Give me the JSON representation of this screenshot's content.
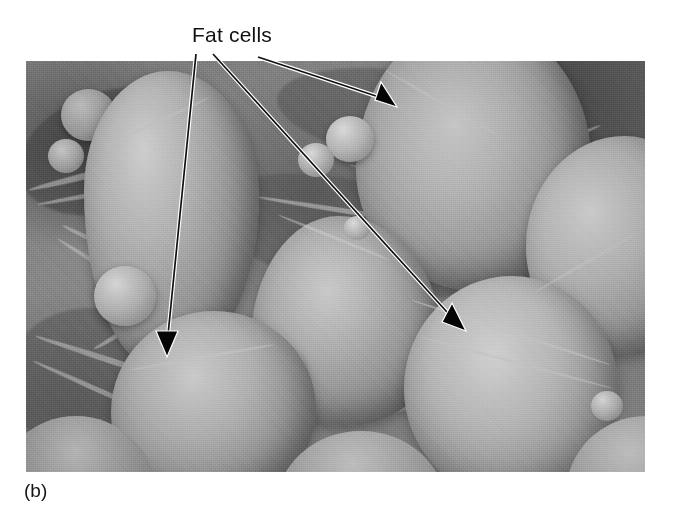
{
  "figure": {
    "domain": "scanning electron micrograph",
    "caption": "(b)",
    "annotation_label": "Fat cells",
    "label_color": "#111111",
    "caption_color": "#141414",
    "background_color": "#ffffff"
  },
  "micrograph": {
    "alt_description": "Grayscale scanning electron micrograph of adipose tissue showing rounded fat cells embedded in a fibrous connective-tissue matrix",
    "frame": {
      "x": 26,
      "y": 61,
      "width": 619,
      "height": 411
    },
    "tone": {
      "light": "#d8d8d8",
      "mid": "#8b8b8b",
      "dark": "#3c3c3c"
    }
  },
  "leader_lines": [
    {
      "name": "arrow-to-lower-left-cell",
      "points_at": "fat cell lower left",
      "tail": {
        "x": 196,
        "y": 54
      },
      "tip": {
        "x": 167,
        "y": 357
      }
    },
    {
      "name": "arrow-to-lower-right-cell",
      "points_at": "fat cell lower right",
      "tail": {
        "x": 213,
        "y": 54
      },
      "tip": {
        "x": 466,
        "y": 331
      }
    },
    {
      "name": "arrow-to-upper-right-cell",
      "points_at": "fat cell upper right",
      "tail": {
        "x": 258,
        "y": 57
      },
      "tip": {
        "x": 397,
        "y": 107
      }
    }
  ],
  "arrow_style": {
    "stroke_color": "#101010",
    "stroke_width": 1.6,
    "head_color": "#050505",
    "outline_color": "#ffffff",
    "outline_width": 3.4
  }
}
